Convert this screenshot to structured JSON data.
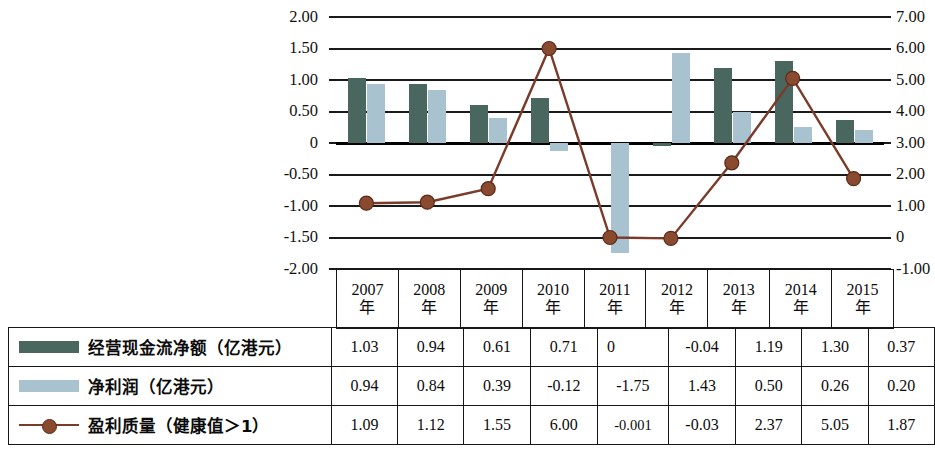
{
  "chart_data": {
    "type": "bar",
    "title": "",
    "xlabel": "",
    "ylabel": "",
    "grid": true,
    "legend_position": "bottom-table",
    "categories": [
      "2007年",
      "2008年",
      "2009年",
      "2010年",
      "2011年",
      "2012年",
      "2013年",
      "2014年",
      "2015年"
    ],
    "left_axis": {
      "label": "",
      "ylim": [
        -2.0,
        2.0
      ],
      "ticks": [
        "2.00",
        "1.50",
        "1.00",
        "0.50",
        "0",
        "-0.50",
        "-1.00",
        "-1.50",
        "-2.00"
      ],
      "tick_values": [
        2.0,
        1.5,
        1.0,
        0.5,
        0,
        -0.5,
        -1.0,
        -1.5,
        -2.0
      ]
    },
    "right_axis": {
      "label": "",
      "ylim": [
        -1.0,
        7.0
      ],
      "ticks": [
        "7.00",
        "6.00",
        "5.00",
        "4.00",
        "3.00",
        "2.00",
        "1.00",
        "0",
        "-1.00"
      ],
      "tick_values": [
        7.0,
        6.0,
        5.0,
        4.0,
        3.0,
        2.0,
        1.0,
        0,
        -1.0
      ]
    },
    "series": [
      {
        "name": "经营现金流净额（亿港元）",
        "kind": "bar",
        "axis": "left",
        "color": "#49675f",
        "values": [
          1.03,
          0.94,
          0.61,
          0.71,
          0,
          -0.04,
          1.19,
          1.3,
          0.37
        ],
        "labels": [
          "1.03",
          "0.94",
          "0.61",
          "0.71",
          "0",
          "-0.04",
          "1.19",
          "1.30",
          "0.37"
        ]
      },
      {
        "name": "净利润（亿港元）",
        "kind": "bar",
        "axis": "left",
        "color": "#a9c2cf",
        "values": [
          0.94,
          0.84,
          0.39,
          -0.12,
          -1.75,
          1.43,
          0.5,
          0.26,
          0.2
        ],
        "labels": [
          "0.94",
          "0.84",
          "0.39",
          "-0.12",
          "-1.75",
          "1.43",
          "0.50",
          "0.26",
          "0.20"
        ]
      },
      {
        "name": "盈利质量（健康值＞1）",
        "kind": "line",
        "axis": "right",
        "color": "#7a3b2a",
        "marker_color": "#8a4a2f",
        "values": [
          1.09,
          1.12,
          1.55,
          6.0,
          -0.001,
          -0.03,
          2.37,
          5.05,
          1.87
        ],
        "labels": [
          "1.09",
          "1.12",
          "1.55",
          "6.00",
          "-0.001",
          "-0.03",
          "2.37",
          "5.05",
          "1.87"
        ]
      }
    ]
  },
  "table": {
    "year_header": [
      "2007年",
      "2008年",
      "2009年",
      "2010年",
      "2011年",
      "2012年",
      "2013年",
      "2014年",
      "2015年"
    ],
    "year_header_num": [
      "2007",
      "2008",
      "2009",
      "2010",
      "2011",
      "2012",
      "2013",
      "2014",
      "2015"
    ],
    "year_header_unit": [
      "年",
      "年",
      "年",
      "年",
      "年",
      "年",
      "年",
      "年",
      "年"
    ],
    "rows": [
      {
        "legend_label": "经营现金流净额（亿港元）",
        "swatch": "cash-swatch",
        "values": [
          "1.03",
          "0.94",
          "0.61",
          "0.71",
          "0",
          "-0.04",
          "1.19",
          "1.30",
          "0.37"
        ]
      },
      {
        "legend_label": "净利润（亿港元）",
        "swatch": "profit-swatch",
        "values": [
          "0.94",
          "0.84",
          "0.39",
          "-0.12",
          "-1.75",
          "1.43",
          "0.50",
          "0.26",
          "0.20"
        ]
      },
      {
        "legend_label": "盈利质量（健康值＞1）",
        "swatch": "line-swatch",
        "values": [
          "1.09",
          "1.12",
          "1.55",
          "6.00",
          "-0.001",
          "-0.03",
          "2.37",
          "5.05",
          "1.87"
        ]
      }
    ]
  },
  "colors": {
    "cash_bar": "#49675f",
    "profit_bar": "#a9c2cf",
    "line": "#7a3b2a",
    "marker": "#8a4a2f",
    "axis": "#1a1a1a"
  }
}
